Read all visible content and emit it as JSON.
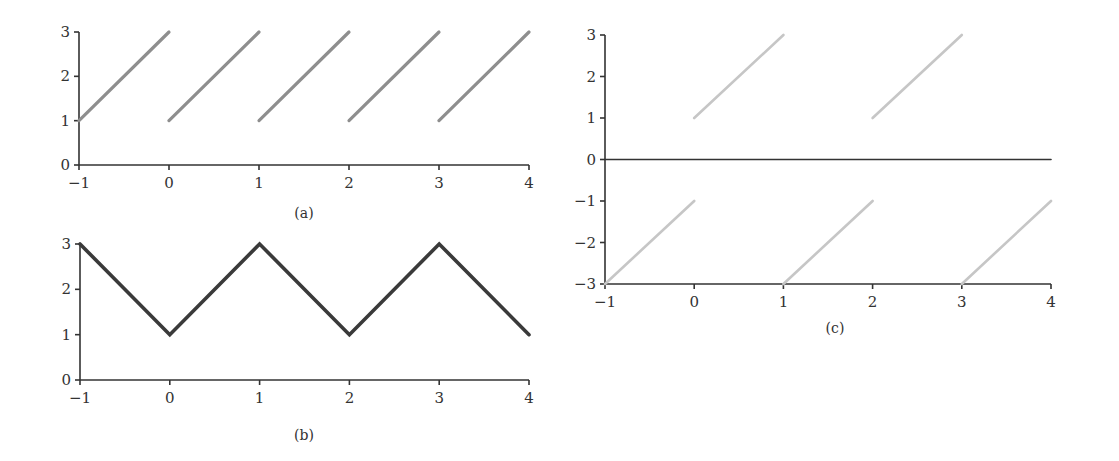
{
  "chart_data": [
    {
      "id": "a",
      "caption": "(a)",
      "type": "line",
      "title": "",
      "xlabel": "",
      "ylabel": "",
      "xlim": [
        -1,
        4
      ],
      "ylim": [
        0,
        3
      ],
      "xticks": [
        "-1",
        "0",
        "1",
        "2",
        "3",
        "4"
      ],
      "yticks": [
        "0",
        "1",
        "2",
        "3"
      ],
      "grid": false,
      "line_color": "#8e8e8e",
      "series": [
        {
          "name": "segment-1",
          "x": [
            -1,
            0
          ],
          "y": [
            1,
            3
          ]
        },
        {
          "name": "segment-2",
          "x": [
            0,
            1
          ],
          "y": [
            1,
            3
          ]
        },
        {
          "name": "segment-3",
          "x": [
            1,
            2
          ],
          "y": [
            1,
            3
          ]
        },
        {
          "name": "segment-4",
          "x": [
            2,
            3
          ],
          "y": [
            1,
            3
          ]
        },
        {
          "name": "segment-5",
          "x": [
            3,
            4
          ],
          "y": [
            1,
            3
          ]
        }
      ]
    },
    {
      "id": "b",
      "caption": "(b)",
      "type": "line",
      "title": "",
      "xlabel": "",
      "ylabel": "",
      "xlim": [
        -1,
        4
      ],
      "ylim": [
        0,
        3
      ],
      "xticks": [
        "-1",
        "0",
        "1",
        "2",
        "3",
        "4"
      ],
      "yticks": [
        "0",
        "1",
        "2",
        "3"
      ],
      "grid": false,
      "line_color": "#3a3a3a",
      "series": [
        {
          "name": "triangle-wave",
          "x": [
            -1,
            0,
            1,
            2,
            3,
            4
          ],
          "y": [
            3,
            1,
            3,
            1,
            3,
            1
          ]
        }
      ]
    },
    {
      "id": "c",
      "caption": "(c)",
      "type": "line",
      "title": "",
      "xlabel": "",
      "ylabel": "",
      "xlim": [
        -1,
        4
      ],
      "ylim": [
        -3,
        3
      ],
      "xticks": [
        "-1",
        "0",
        "1",
        "2",
        "3",
        "4"
      ],
      "yticks": [
        "-3",
        "-2",
        "-1",
        "0",
        "1",
        "2",
        "3"
      ],
      "grid": false,
      "line_color": "#c6c6c6",
      "zero_line_color": "#333333",
      "series": [
        {
          "name": "zero-line",
          "x": [
            -1,
            4
          ],
          "y": [
            0,
            0
          ]
        },
        {
          "name": "upper-segment-1",
          "x": [
            0,
            1
          ],
          "y": [
            1,
            3
          ]
        },
        {
          "name": "upper-segment-2",
          "x": [
            2,
            3
          ],
          "y": [
            1,
            3
          ]
        },
        {
          "name": "lower-segment-1",
          "x": [
            -1,
            0
          ],
          "y": [
            -3,
            -1
          ]
        },
        {
          "name": "lower-segment-2",
          "x": [
            1,
            2
          ],
          "y": [
            -3,
            -1
          ]
        },
        {
          "name": "lower-segment-3",
          "x": [
            3,
            4
          ],
          "y": [
            -3,
            -1
          ]
        }
      ]
    }
  ]
}
